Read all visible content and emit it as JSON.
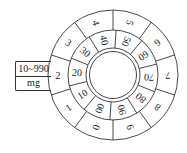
{
  "unit_box": {
    "range": "10~990",
    "unit": "mg"
  },
  "outer_ring": {
    "labels": [
      "0",
      "1",
      "2",
      "3",
      "4",
      "5",
      "6",
      "7",
      "8",
      "9"
    ]
  },
  "inner_ring": {
    "labels": [
      "00",
      "10",
      "20",
      "30",
      "40",
      "50",
      "60",
      "70",
      "80",
      "90"
    ]
  },
  "colors": {
    "stroke": "#333333",
    "text": "#222222",
    "background": "#ffffff"
  }
}
